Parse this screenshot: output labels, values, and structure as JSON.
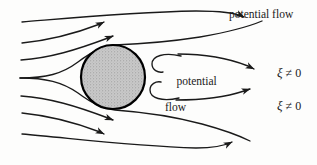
{
  "figure": {
    "background_color": "#fdfdfc",
    "line_color": "#1a1a1a",
    "body_fill_color": "#c6c6c6",
    "body_stroke_color": "#000000"
  },
  "labels": {
    "potential_flow_top": "potential flow",
    "potential_flow_center_line1": "potential",
    "potential_flow_center_line2": "flow",
    "xi_upper": "ξ ≠ 0",
    "xi_lower": "ξ ≠ 0",
    "xi_symbol": "ξ",
    "xi_relation": " ≠ 0"
  },
  "diagram_data": {
    "type": "streamline-diagram",
    "body": {
      "shape": "circle",
      "center_x": 113,
      "center_y": 77,
      "radius": 32,
      "fill": "#c6c6c6",
      "stroke_width": 2.2,
      "texture": "stipple"
    },
    "regions": [
      {
        "name": "upper-potential-flow",
        "label": "potential flow"
      },
      {
        "name": "wake-recirculation",
        "label": "potential flow"
      },
      {
        "name": "upper-shear-layer",
        "label": "ξ ≠ 0"
      },
      {
        "name": "lower-shear-layer",
        "label": "ξ ≠ 0"
      }
    ],
    "streamlines": [
      {
        "name": "upper-outer-1",
        "arrow": true,
        "direction": "rightward"
      },
      {
        "name": "upper-outer-2",
        "arrow": true,
        "direction": "rightward"
      },
      {
        "name": "upper-outer-3",
        "arrow": true,
        "direction": "rightward"
      },
      {
        "name": "stagnation-upper",
        "arrow": false,
        "direction": "rightward"
      },
      {
        "name": "stagnation-lower",
        "arrow": false,
        "direction": "rightward"
      },
      {
        "name": "lower-outer-1",
        "arrow": true,
        "direction": "rightward"
      },
      {
        "name": "lower-outer-2",
        "arrow": true,
        "direction": "rightward"
      },
      {
        "name": "lower-outer-3",
        "arrow": true,
        "direction": "rightward"
      },
      {
        "name": "wake-hook-upper",
        "arrow": false,
        "direction": "recirculating"
      },
      {
        "name": "wake-hook-lower",
        "arrow": false,
        "direction": "recirculating"
      },
      {
        "name": "shear-layer-upper",
        "arrow": true,
        "direction": "rightward"
      },
      {
        "name": "shear-layer-lower",
        "arrow": true,
        "direction": "rightward"
      }
    ]
  }
}
